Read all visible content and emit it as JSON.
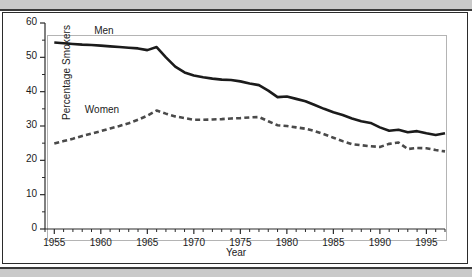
{
  "figure": {
    "background_color": "#ffffff",
    "frame_color": "#2b2b2b",
    "band_color": "#c9c9c9"
  },
  "chart_data": {
    "type": "line",
    "title": "",
    "xlabel": "Year",
    "ylabel": "Percentage Smokers",
    "xlim": [
      1954,
      1997
    ],
    "ylim": [
      0,
      60
    ],
    "xticks": [
      1955,
      1960,
      1965,
      1970,
      1975,
      1980,
      1985,
      1990,
      1995
    ],
    "xtick_labels": [
      "1955",
      "1960",
      "1965",
      "1970",
      "1975",
      "1980",
      "1985",
      "1990",
      "1995"
    ],
    "yticks": [
      0,
      10,
      20,
      30,
      40,
      50,
      60
    ],
    "ytick_labels": [
      "0",
      "10",
      "20",
      "30",
      "40",
      "50",
      "60"
    ],
    "x_minor_tick_interval": 1,
    "y_minor_tick_interval": 5,
    "grid": false,
    "legend_position": "inline-annotations",
    "annotations": [
      {
        "text": "Men",
        "x": 1959.5,
        "y": 57.5
      },
      {
        "text": "Women",
        "x": 1958.5,
        "y": 34.5
      }
    ],
    "series": [
      {
        "name": "Men",
        "label": "Men",
        "style": "solid",
        "color": "#1b1b1b",
        "line_width": 2.6,
        "x": [
          1955,
          1956,
          1957,
          1958,
          1959,
          1960,
          1961,
          1962,
          1963,
          1964,
          1965,
          1966,
          1967,
          1968,
          1969,
          1970,
          1971,
          1972,
          1973,
          1974,
          1975,
          1976,
          1977,
          1978,
          1979,
          1980,
          1981,
          1982,
          1983,
          1984,
          1985,
          1986,
          1987,
          1988,
          1989,
          1990,
          1991,
          1992,
          1993,
          1994,
          1995,
          1996,
          1997
        ],
        "values": [
          54.3,
          54.1,
          53.9,
          53.7,
          53.6,
          53.4,
          53.2,
          53.0,
          52.8,
          52.6,
          52.1,
          53.0,
          50.0,
          47.3,
          45.6,
          44.7,
          44.2,
          43.8,
          43.5,
          43.4,
          43.0,
          42.4,
          41.9,
          40.3,
          38.4,
          38.6,
          37.9,
          37.2,
          36.1,
          35.0,
          34.0,
          33.2,
          32.2,
          31.4,
          30.9,
          29.6,
          28.6,
          28.9,
          28.2,
          28.5,
          27.9,
          27.4,
          27.9
        ]
      },
      {
        "name": "Women",
        "label": "Women",
        "style": "dashed",
        "color": "#4a4a4a",
        "line_width": 2.6,
        "x": [
          1955,
          1956,
          1957,
          1958,
          1959,
          1960,
          1961,
          1962,
          1963,
          1964,
          1965,
          1966,
          1967,
          1968,
          1969,
          1970,
          1971,
          1972,
          1973,
          1974,
          1975,
          1976,
          1977,
          1978,
          1979,
          1980,
          1981,
          1982,
          1983,
          1984,
          1985,
          1986,
          1987,
          1988,
          1989,
          1990,
          1991,
          1992,
          1993,
          1994,
          1995,
          1996,
          1997
        ],
        "values": [
          24.9,
          25.6,
          26.3,
          27.1,
          27.8,
          28.5,
          29.3,
          30.0,
          30.8,
          31.8,
          33.0,
          34.5,
          33.6,
          32.8,
          32.3,
          31.8,
          31.8,
          31.9,
          32.0,
          32.2,
          32.3,
          32.5,
          32.6,
          31.4,
          30.2,
          30.0,
          29.6,
          29.2,
          28.5,
          27.6,
          26.6,
          25.6,
          24.7,
          24.4,
          24.1,
          23.9,
          24.8,
          25.2,
          23.3,
          23.6,
          23.5,
          23.0,
          22.6
        ]
      }
    ]
  }
}
